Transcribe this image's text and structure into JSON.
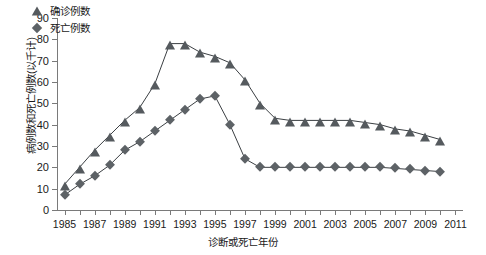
{
  "chart_data": {
    "type": "line",
    "title": "",
    "xlabel": "诊断或死亡年份",
    "ylabel": "病例数和死亡例数(以千计)",
    "ylim": [
      0,
      90
    ],
    "ytick_labels": [
      "0",
      "10",
      "20",
      "30",
      "40",
      "50",
      "60",
      "70",
      "80",
      "90"
    ],
    "ytick_values": [
      0,
      10,
      20,
      30,
      40,
      50,
      60,
      70,
      80,
      90
    ],
    "xlim": [
      1984.5,
      2011.5
    ],
    "xtick_labels": [
      "1985",
      "1987",
      "1989",
      "1991",
      "1993",
      "1995",
      "1997",
      "1999",
      "2001",
      "2003",
      "2005",
      "2007",
      "2009",
      "2011"
    ],
    "xtick_values": [
      1985,
      1987,
      1989,
      1991,
      1993,
      1995,
      1997,
      1999,
      2001,
      2003,
      2005,
      2007,
      2009,
      2011
    ],
    "grid": false,
    "legend_position": "upper-left-inside",
    "x": [
      1985,
      1986,
      1987,
      1988,
      1989,
      1990,
      1991,
      1992,
      1993,
      1994,
      1995,
      1996,
      1997,
      1998,
      1999,
      2000,
      2001,
      2002,
      2003,
      2004,
      2005,
      2006,
      2007,
      2008,
      2009,
      2010
    ],
    "series": [
      {
        "name": "确诊例数",
        "marker": "triangle",
        "color": "#555a5e",
        "values": [
          12,
          20,
          28,
          35,
          42,
          48,
          59,
          78,
          78,
          74,
          72,
          69,
          61,
          50,
          43,
          42,
          42,
          42,
          42,
          42,
          41,
          40,
          38,
          37,
          35,
          33
        ]
      },
      {
        "name": "死亡例数",
        "marker": "diamond",
        "color": "#5d6266",
        "values": [
          7,
          12,
          16,
          21,
          28,
          32,
          37,
          42,
          47,
          52,
          53.5,
          40,
          24,
          20,
          20,
          20,
          20,
          20,
          20,
          20,
          20,
          20,
          19.5,
          19,
          18.5,
          18
        ]
      }
    ],
    "last_x_tick_only": 2011
  },
  "legend": {
    "items": [
      {
        "label": "确诊例数",
        "icon": "triangle-marker-icon"
      },
      {
        "label": "死亡例数",
        "icon": "diamond-marker-icon"
      }
    ]
  }
}
